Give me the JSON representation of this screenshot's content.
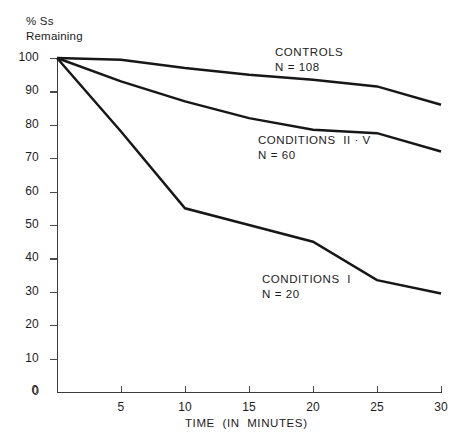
{
  "chart_data": {
    "type": "line",
    "title": "",
    "xlabel": "TIME  (IN  MINUTES)",
    "ylabel_line1": "% Ss",
    "ylabel_line2": "Remaining",
    "x": [
      0,
      5,
      10,
      15,
      20,
      25,
      30
    ],
    "xlim": [
      0,
      30
    ],
    "ylim": [
      0,
      100
    ],
    "xticks": [
      0,
      5,
      10,
      15,
      20,
      25,
      30
    ],
    "xtick_labels": [
      "0",
      "5",
      "10",
      "15",
      "20",
      "25",
      "30"
    ],
    "yticks": [
      0,
      10,
      20,
      30,
      40,
      50,
      60,
      70,
      80,
      90,
      100
    ],
    "ytick_labels": [
      "0",
      "10",
      "20",
      "30",
      "40",
      "50",
      "60",
      "70",
      "80",
      "90",
      "100"
    ],
    "grid": false,
    "legend_position": "inline-annotations",
    "line_color": "#171717",
    "axis_color": "#3b3b3b",
    "background": "#ffffff",
    "series": [
      {
        "name": "CONTROLS",
        "n_label": "N = 108",
        "values": [
          100,
          99.5,
          97,
          95,
          93.5,
          91.5,
          86
        ],
        "label_x": 275,
        "label_y": 45
      },
      {
        "name": "CONDITIONS  II · V",
        "n_label": "N = 60",
        "values": [
          100,
          93,
          87,
          82,
          78.5,
          77.5,
          72
        ],
        "label_x": 258,
        "label_y": 133
      },
      {
        "name": "CONDITIONS  I",
        "n_label": "N = 20",
        "values": [
          100,
          78,
          55,
          50,
          45,
          33.5,
          29.5
        ],
        "label_x": 262,
        "label_y": 272
      }
    ]
  },
  "geometry": {
    "plot_left": 57,
    "plot_right": 441,
    "plot_top": 58,
    "plot_bottom": 392
  }
}
